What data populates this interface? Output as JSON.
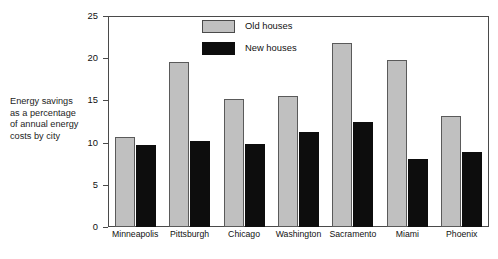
{
  "chart_data": {
    "type": "bar",
    "title": "",
    "subtitle": "",
    "xlabel": "",
    "ylabel": "Energy savings\nas a percentage\nof annual energy\ncosts by city",
    "categories": [
      "Minneapolis",
      "Pittsburgh",
      "Chicago",
      "Washington",
      "Sacramento",
      "Miami",
      "Phoenix"
    ],
    "series": [
      {
        "name": "Old houses",
        "color": "#c0c0c0",
        "values": [
          10.7,
          19.5,
          15.2,
          15.5,
          21.8,
          19.8,
          13.2
        ]
      },
      {
        "name": "New houses",
        "color": "#0d0d0d",
        "values": [
          9.7,
          10.2,
          9.8,
          11.2,
          12.4,
          8.1,
          8.9
        ]
      }
    ],
    "ylim": [
      0,
      25
    ],
    "yticks": [
      0,
      5,
      10,
      15,
      20,
      25
    ],
    "ytick_labels": [
      "0",
      "5",
      "10",
      "15",
      "20",
      "25"
    ],
    "grid": false,
    "legend_position": "top-center",
    "annotations": []
  },
  "axis": {
    "caption": "Energy savings\nas a percentage\nof annual energy\ncosts by city"
  },
  "legend": {
    "entries": [
      {
        "label": "Old houses"
      },
      {
        "label": "New houses"
      }
    ]
  }
}
